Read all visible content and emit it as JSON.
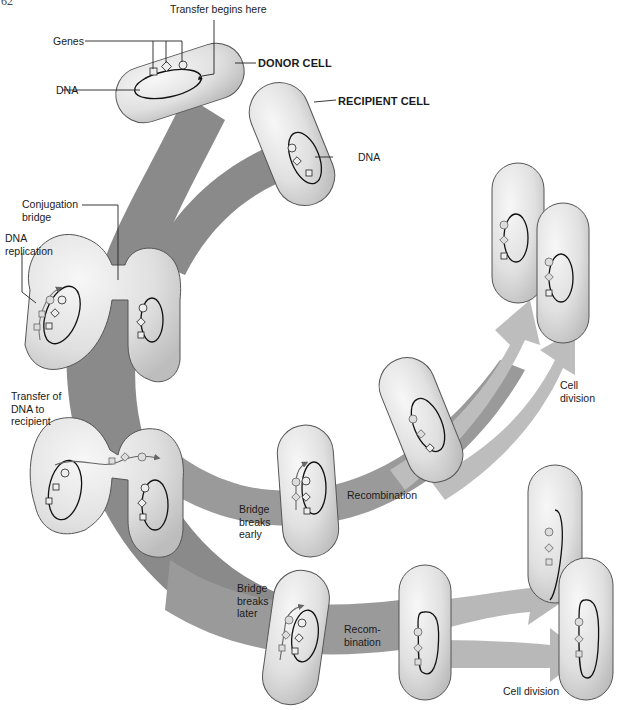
{
  "page_number": "62",
  "colors": {
    "background": "#ffffff",
    "main_band": "#8a8a8a",
    "early_band": "#b8b8b8",
    "late_band": "#a6a6a6",
    "cell_fill": "#e4e4e4",
    "cell_stroke": "#555555",
    "dna_stroke": "#111111"
  },
  "labels": {
    "transfer_begins": "Transfer begins here",
    "genes": "Genes",
    "donor_dna": "DNA",
    "donor_cell": "DONOR CELL",
    "recipient_cell": "RECIPIENT CELL",
    "recipient_dna": "DNA",
    "conjugation_bridge": "Conjugation\nbridge",
    "dna_replication": "DNA\nreplication",
    "transfer_to_recipient": "Transfer of\nDNA to\nrecipient",
    "bridge_breaks_early": "Bridge\nbreaks\nearly",
    "recombination_early": "Recombination",
    "cell_division_early": "Cell\ndivision",
    "bridge_breaks_later": "Bridge\nbreaks\nlater",
    "recombination_later": "Recom-\nbination",
    "cell_division_later": "Cell division"
  },
  "stages": [
    {
      "id": "donor",
      "name": "Donor cell with DNA and genes"
    },
    {
      "id": "recipient",
      "name": "Recipient cell with DNA"
    },
    {
      "id": "bridge",
      "name": "Conjugation bridge with DNA replication"
    },
    {
      "id": "transfer",
      "name": "Transfer of DNA to recipient"
    },
    {
      "id": "early",
      "name": "Bridge breaks early → Recombination → Cell division"
    },
    {
      "id": "later",
      "name": "Bridge breaks later → Recombination → Cell division"
    }
  ]
}
